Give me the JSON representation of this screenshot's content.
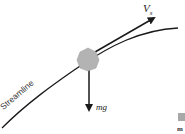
{
  "diagram": {
    "title": "",
    "labels": {
      "velocity_main": "V",
      "velocity_sub": "s",
      "weight": "mg",
      "streamline": "Streamline"
    },
    "elements": [
      {
        "name": "streamline-curve",
        "description": "curved path from bottom-left to top-right"
      },
      {
        "name": "particle",
        "description": "gray irregular blob on streamline",
        "color": "#b0b0b0"
      },
      {
        "name": "velocity-vector",
        "description": "arrow tangent to streamline pointing up-right",
        "label": "V_s"
      },
      {
        "name": "weight-vector",
        "description": "arrow pointing straight down",
        "label": "mg"
      }
    ],
    "colors": {
      "line": "#1a1a1a",
      "particle": "#b3b3b3",
      "background": "#ffffff"
    },
    "clipped_fragment": "m"
  }
}
